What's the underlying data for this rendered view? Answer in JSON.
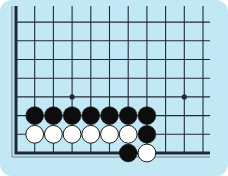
{
  "diagram": {
    "type": "go-board-corner",
    "colors": {
      "background": "#c3e8f5",
      "grid": "#1e2a38",
      "black_stone": "#0d0d0d",
      "white_stone": "#ffffff",
      "stone_outline": "#1a1a1a"
    },
    "grid": {
      "origin_x": 16,
      "origin_y": 153,
      "spacing": 18.7,
      "columns": 11,
      "rows": 8
    },
    "star_points": [
      {
        "col": 3,
        "row": 3
      },
      {
        "col": 9,
        "row": 3
      }
    ],
    "stones": [
      {
        "color": "black",
        "col": 1,
        "row": 2
      },
      {
        "color": "black",
        "col": 2,
        "row": 2
      },
      {
        "color": "black",
        "col": 3,
        "row": 2
      },
      {
        "color": "black",
        "col": 4,
        "row": 2
      },
      {
        "color": "black",
        "col": 5,
        "row": 2
      },
      {
        "color": "black",
        "col": 6,
        "row": 2
      },
      {
        "color": "black",
        "col": 7,
        "row": 2
      },
      {
        "color": "white",
        "col": 1,
        "row": 1
      },
      {
        "color": "white",
        "col": 2,
        "row": 1
      },
      {
        "color": "white",
        "col": 3,
        "row": 1
      },
      {
        "color": "white",
        "col": 4,
        "row": 1
      },
      {
        "color": "white",
        "col": 5,
        "row": 1
      },
      {
        "color": "white",
        "col": 6,
        "row": 1
      },
      {
        "color": "black",
        "col": 7,
        "row": 1
      },
      {
        "color": "black",
        "col": 6,
        "row": 0
      },
      {
        "color": "white",
        "col": 7,
        "row": 0
      }
    ]
  }
}
